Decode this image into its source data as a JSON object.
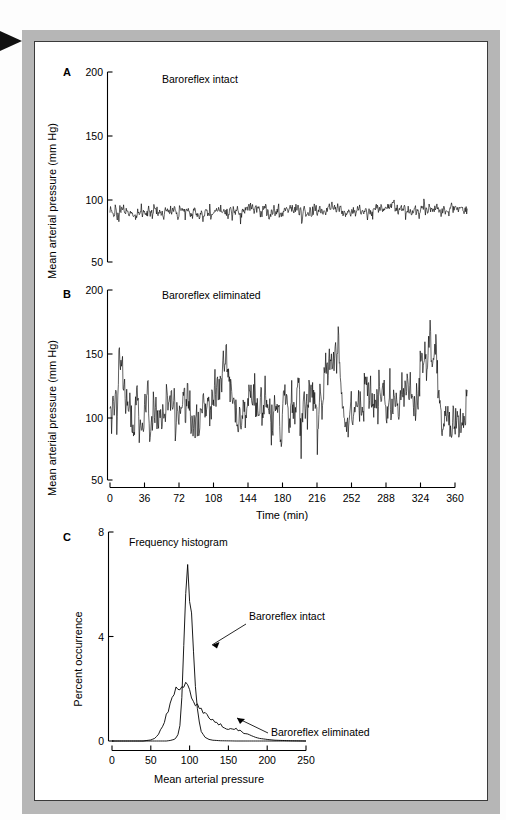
{
  "figure": {
    "edge_marker": "triangle-right",
    "frame_color": "#b6b6b6",
    "panel_background": "#ffffff",
    "line_color": "#000000"
  },
  "panels": {
    "a": {
      "letter": "A",
      "annotation": "Baroreflex intact",
      "ylabel": "Mean arterial pressure (mm Hg)",
      "yticks": [
        200,
        150,
        100,
        50
      ],
      "ylim": [
        50,
        210
      ],
      "xlim": [
        0,
        360
      ]
    },
    "b": {
      "letter": "B",
      "annotation": "Baroreflex eliminated",
      "ylabel": "Mean arterial pressure (mm Hg)",
      "yticks": [
        200,
        150,
        100,
        50
      ],
      "ylim": [
        50,
        210
      ],
      "xlabel": "Time (min)",
      "xticks": [
        0,
        36,
        72,
        108,
        144,
        180,
        216,
        252,
        288,
        324,
        360
      ],
      "xlim": [
        0,
        360
      ]
    },
    "c": {
      "letter": "C",
      "annotation": "Frequency histogram",
      "label_intact": "Baroreflex intact",
      "label_eliminated": "Baroreflex eliminated",
      "ylabel": "Percent occurrence",
      "yticks": [
        8,
        4,
        0
      ],
      "ylim": [
        0,
        8
      ],
      "xlabel": "Mean arterial pressure",
      "xticks": [
        0,
        50,
        100,
        150,
        200,
        250
      ],
      "xlim": [
        0,
        250
      ]
    }
  },
  "chart_data": [
    {
      "type": "line",
      "id": "panel-a-trace",
      "title": "Baroreflex intact",
      "xlabel": "Time (min)",
      "ylabel": "Mean arterial pressure (mm Hg)",
      "xlim": [
        0,
        360
      ],
      "ylim": [
        50,
        210
      ],
      "grid": false,
      "legend": "none",
      "sampling_minutes": 0.5,
      "series_summary": {
        "mean": 93,
        "sd": 5.5,
        "spike_amplitude": 14,
        "range_observed": [
          76,
          118
        ]
      },
      "envelope_x": [
        0,
        12,
        24,
        36,
        48,
        60,
        72,
        84,
        96,
        108,
        120,
        132,
        144,
        156,
        168,
        180,
        192,
        204,
        216,
        228,
        240,
        252,
        264,
        276,
        288,
        300,
        312,
        324,
        336,
        342
      ],
      "envelope_mean": [
        91,
        94,
        92,
        90,
        92,
        91,
        94,
        92,
        91,
        93,
        92,
        94,
        93,
        91,
        93,
        94,
        92,
        93,
        95,
        93,
        92,
        94,
        96,
        95,
        93,
        95,
        94,
        93,
        95,
        94
      ]
    },
    {
      "type": "line",
      "id": "panel-b-trace",
      "title": "Baroreflex eliminated",
      "xlabel": "Time (min)",
      "ylabel": "Mean arterial pressure (mm Hg)",
      "xlim": [
        0,
        360
      ],
      "ylim": [
        50,
        210
      ],
      "grid": false,
      "legend": "none",
      "sampling_minutes": 0.5,
      "series_summary": {
        "mean": 108,
        "sd": 22,
        "spike_amplitude": 45,
        "range_observed": [
          57,
          197
        ]
      },
      "envelope_x": [
        0,
        6,
        10,
        14,
        20,
        30,
        36,
        44,
        52,
        60,
        66,
        72,
        80,
        88,
        96,
        104,
        110,
        114,
        120,
        126,
        132,
        140,
        146,
        152,
        160,
        168,
        176,
        184,
        192,
        200,
        208,
        214,
        218,
        224,
        232,
        240,
        246,
        252,
        260,
        268,
        276,
        284,
        292,
        300,
        306,
        312,
        318,
        326,
        334,
        342
      ],
      "envelope_mean": [
        95,
        115,
        150,
        120,
        105,
        100,
        112,
        102,
        105,
        110,
        104,
        118,
        100,
        108,
        112,
        130,
        155,
        150,
        105,
        95,
        108,
        122,
        118,
        100,
        105,
        112,
        115,
        118,
        120,
        110,
        140,
        160,
        155,
        112,
        100,
        118,
        128,
        105,
        112,
        116,
        114,
        118,
        112,
        150,
        158,
        150,
        100,
        96,
        100,
        110
      ]
    },
    {
      "type": "line",
      "id": "panel-c-histogram",
      "title": "Frequency histogram",
      "xlabel": "Mean arterial pressure",
      "ylabel": "Percent occurrence",
      "xlim": [
        0,
        250
      ],
      "ylim": [
        0,
        8
      ],
      "grid": false,
      "legend": "annotated-arrows",
      "bin_width": 2.5,
      "series": [
        {
          "name": "Baroreflex intact",
          "x": [
            0,
            50,
            60,
            70,
            75,
            80,
            82.5,
            85,
            87.5,
            90,
            92.5,
            95,
            97.5,
            100,
            102.5,
            105,
            107.5,
            110,
            112.5,
            115,
            120,
            125,
            130,
            140,
            160,
            200,
            250
          ],
          "values": [
            0,
            0,
            0,
            0,
            0.02,
            0.06,
            0.12,
            0.25,
            0.6,
            1.6,
            3.6,
            5.6,
            6.7,
            5.4,
            4.9,
            3.4,
            2.1,
            1.2,
            0.7,
            0.38,
            0.14,
            0.06,
            0.03,
            0.01,
            0,
            0,
            0
          ]
        },
        {
          "name": "Baroreflex eliminated",
          "x": [
            0,
            40,
            50,
            55,
            60,
            65,
            70,
            75,
            77.5,
            80,
            82.5,
            85,
            87.5,
            90,
            92.5,
            95,
            97.5,
            100,
            105,
            110,
            115,
            120,
            125,
            130,
            135,
            140,
            145,
            150,
            155,
            160,
            165,
            170,
            175,
            180,
            185,
            190,
            200,
            210,
            220,
            230,
            250
          ],
          "values": [
            0,
            0,
            0.04,
            0.1,
            0.25,
            0.55,
            1.0,
            1.5,
            1.72,
            1.8,
            1.95,
            2.0,
            2.05,
            2.12,
            2.0,
            2.1,
            2.0,
            1.85,
            1.6,
            1.35,
            1.15,
            1.0,
            0.9,
            0.82,
            0.72,
            0.6,
            0.52,
            0.46,
            0.5,
            0.48,
            0.38,
            0.3,
            0.25,
            0.2,
            0.14,
            0.1,
            0.06,
            0.03,
            0.02,
            0.01,
            0
          ]
        }
      ]
    }
  ]
}
